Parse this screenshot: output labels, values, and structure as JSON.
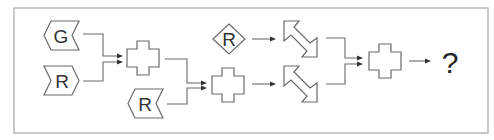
{
  "diagram": {
    "type": "symbol-transformation-puzzle",
    "inputs": [
      {
        "id": "g-chevron",
        "shape": "left-notched-chevron",
        "label": "G"
      },
      {
        "id": "r-chevron-right",
        "shape": "right-pointing-chevron",
        "label": "R"
      },
      {
        "id": "r-chevron-left",
        "shape": "left-notched-chevron",
        "label": "R"
      },
      {
        "id": "r-diamond",
        "shape": "diamond",
        "label": "R"
      }
    ],
    "operators": [
      {
        "id": "cross-1",
        "shape": "cross",
        "inputs": [
          "g-chevron",
          "r-chevron-right"
        ]
      },
      {
        "id": "cross-2",
        "shape": "cross",
        "inputs": [
          "cross-1",
          "r-chevron-left"
        ]
      },
      {
        "id": "double-arrow-1",
        "shape": "diagonal-double-arrow",
        "inputs": [
          "r-diamond"
        ]
      },
      {
        "id": "double-arrow-2",
        "shape": "diagonal-double-arrow",
        "inputs": [
          "cross-2"
        ]
      },
      {
        "id": "cross-3",
        "shape": "cross",
        "inputs": [
          "double-arrow-1",
          "double-arrow-2"
        ]
      }
    ],
    "output": {
      "label": "?"
    },
    "colors": {
      "stroke": "#6a6a6a",
      "frame": "#b8b8b8",
      "text": "#333333"
    }
  }
}
